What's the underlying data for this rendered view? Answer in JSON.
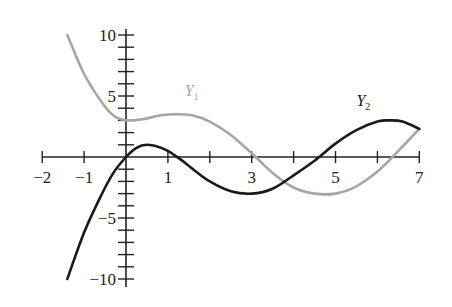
{
  "chart_data": {
    "type": "line",
    "title": "",
    "xlabel": "",
    "ylabel": "",
    "xlim": [
      -2,
      7
    ],
    "ylim": [
      -10,
      10
    ],
    "grid": false,
    "x_ticks": [
      -2,
      -1,
      0,
      1,
      2,
      3,
      4,
      5,
      6,
      7
    ],
    "x_tick_labels": [
      {
        "value": -2,
        "label": "−2"
      },
      {
        "value": -1,
        "label": "−1"
      },
      {
        "value": 1,
        "label": "1"
      },
      {
        "value": 3,
        "label": "3"
      },
      {
        "value": 5,
        "label": "5"
      },
      {
        "value": 7,
        "label": "7"
      }
    ],
    "y_ticks": [
      -10,
      -9,
      -8,
      -7,
      -6,
      -5,
      -4,
      -3,
      -2,
      -1,
      1,
      2,
      3,
      4,
      5,
      6,
      7,
      8,
      9,
      10
    ],
    "y_tick_labels": [
      {
        "value": 10,
        "label": "10"
      },
      {
        "value": 5,
        "label": "5"
      },
      {
        "value": -5,
        "label": "−5"
      },
      {
        "value": -10,
        "label": "−10"
      }
    ],
    "series": [
      {
        "name": "Y1",
        "label_main": "Y",
        "label_sub": "1",
        "color": "#a6a6a6",
        "label_pos": [
          1.4,
          5.0
        ],
        "x": [
          -1.4,
          -1.0,
          -0.6,
          -0.3,
          0.0,
          0.4,
          0.8,
          1.2,
          1.6,
          2.0,
          2.5,
          3.0,
          3.5,
          4.0,
          4.5,
          5.0,
          5.5,
          6.0,
          6.5,
          7.0
        ],
        "y": [
          10.0,
          6.8,
          4.6,
          3.4,
          3.0,
          3.1,
          3.4,
          3.5,
          3.4,
          2.9,
          1.8,
          0.3,
          -1.3,
          -2.5,
          -3.0,
          -3.0,
          -2.4,
          -1.2,
          0.5,
          2.3
        ]
      },
      {
        "name": "Y2",
        "label_main": "Y",
        "label_sub": "2",
        "color": "#1a1a1a",
        "label_pos": [
          5.5,
          4.2
        ],
        "x": [
          -1.4,
          -1.0,
          -0.6,
          -0.3,
          0.0,
          0.25,
          0.5,
          0.8,
          1.0,
          1.3,
          1.6,
          2.0,
          2.5,
          3.0,
          3.5,
          4.0,
          4.5,
          5.0,
          5.5,
          6.0,
          6.3,
          6.6,
          7.0
        ],
        "y": [
          -10.0,
          -6.2,
          -3.2,
          -1.3,
          0.0,
          0.75,
          1.0,
          0.8,
          0.5,
          -0.2,
          -1.0,
          -2.0,
          -2.8,
          -3.0,
          -2.6,
          -1.5,
          -0.3,
          1.1,
          2.2,
          2.9,
          3.0,
          2.9,
          2.3
        ]
      }
    ]
  }
}
